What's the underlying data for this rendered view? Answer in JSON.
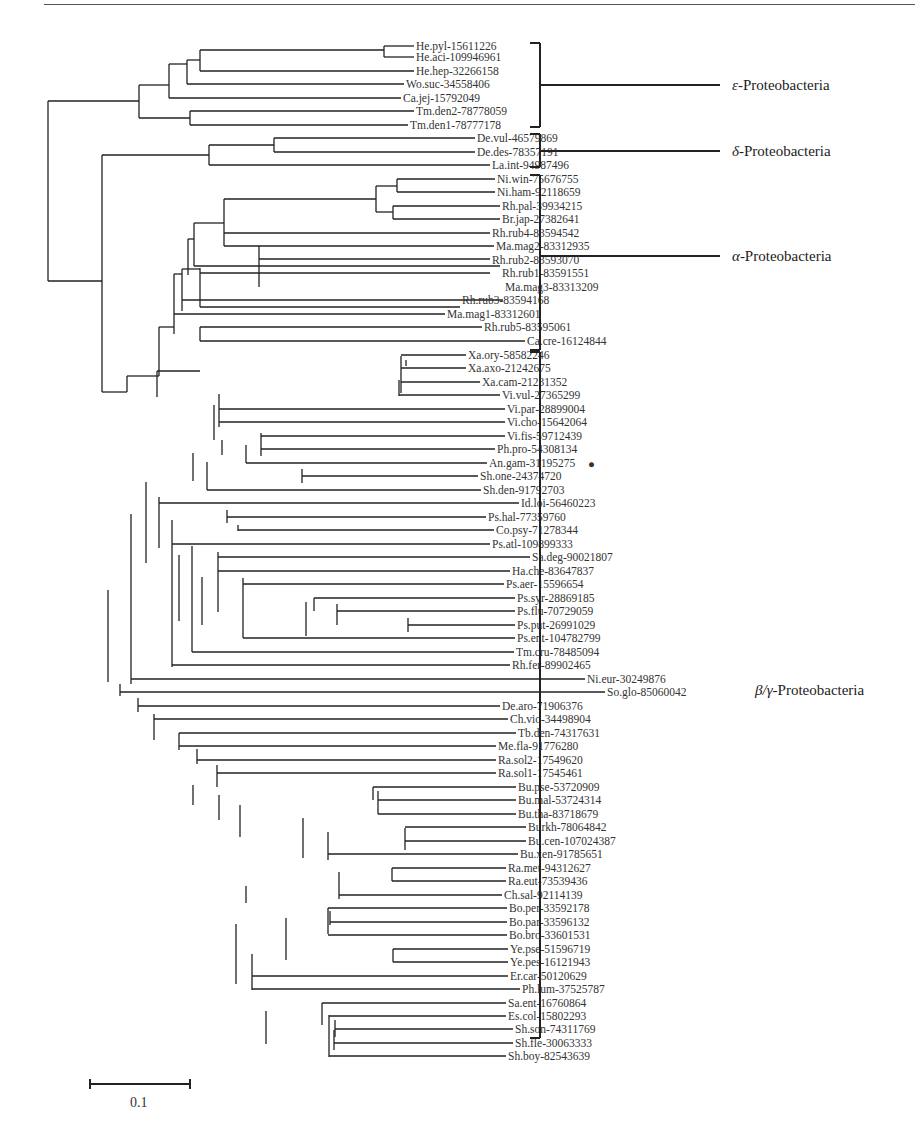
{
  "figure": {
    "type": "phylogenetic-tree",
    "scale_bar": {
      "label": "0.1",
      "x1": 90,
      "x2": 190,
      "y": 1084
    },
    "marker": {
      "leaf": "An.gam-31195275",
      "symbol": "●"
    },
    "clades": [
      {
        "greek": "ε",
        "name": "-Proteobacteria",
        "bracket": {
          "x": 540,
          "y1": 43,
          "y2": 127
        },
        "label_y": 85
      },
      {
        "greek": "δ",
        "name": "-Proteobacteria",
        "bracket": {
          "x": 540,
          "y1": 134,
          "y2": 167
        },
        "label_y": 151
      },
      {
        "greek": "α",
        "name": "-Proteobacteria",
        "bracket": {
          "x": 540,
          "y1": 175,
          "y2": 350
        },
        "label_y": 256
      },
      {
        "greek": "β/γ",
        "name": "-Proteobacteria",
        "bracket": {
          "x": 540,
          "y1": 352,
          "y2": 1038
        },
        "label_y": 690
      }
    ]
  },
  "leaves": [
    {
      "label": "He.pyl-15611226",
      "x": 414,
      "y": 46
    },
    {
      "label": "He.aci-109946961",
      "x": 414,
      "y": 57
    },
    {
      "label": "He.hep-32266158",
      "x": 414,
      "y": 71
    },
    {
      "label": "Wo.suc-34558406",
      "x": 404,
      "y": 84
    },
    {
      "label": "Ca.jej-15792049",
      "x": 401,
      "y": 98
    },
    {
      "label": "Tm.den2-78778059",
      "x": 414,
      "y": 111
    },
    {
      "label": "Tm.den1-78777178",
      "x": 408,
      "y": 125
    },
    {
      "label": "De.vul-46579869",
      "x": 475,
      "y": 138
    },
    {
      "label": "De.des-78357191",
      "x": 475,
      "y": 152
    },
    {
      "label": "La.int-94987496",
      "x": 490,
      "y": 165
    },
    {
      "label": "Ni.win-75676755",
      "x": 495,
      "y": 179
    },
    {
      "label": "Ni.ham-92118659",
      "x": 495,
      "y": 192
    },
    {
      "label": "Rh.pal-39934215",
      "x": 500,
      "y": 206
    },
    {
      "label": "Br.jap-27382641",
      "x": 500,
      "y": 219
    },
    {
      "label": "Rh.rub4-83594542",
      "x": 490,
      "y": 233
    },
    {
      "label": "Ma.mag2-83312935",
      "x": 494,
      "y": 246
    },
    {
      "label": "Rh.rub2-83593070",
      "x": 490,
      "y": 260
    },
    {
      "label": "Rh.rub1-83591551",
      "x": 500,
      "y": 273
    },
    {
      "label": "Ma.mag3-83313209",
      "x": 503,
      "y": 287
    },
    {
      "label": "Rh.rub3-83594168",
      "x": 460,
      "y": 300
    },
    {
      "label": "Ma.mag1-83312601",
      "x": 445,
      "y": 314
    },
    {
      "label": "Rh.rub5-83595061",
      "x": 482,
      "y": 327
    },
    {
      "label": "Ca.cre-16124844",
      "x": 525,
      "y": 341
    },
    {
      "label": "Xa.ory-58582246",
      "x": 466,
      "y": 355
    },
    {
      "label": "Xa.axo-21242675",
      "x": 466,
      "y": 368
    },
    {
      "label": "Xa.cam-21231352",
      "x": 480,
      "y": 382
    },
    {
      "label": "Vi.vul-27365299",
      "x": 500,
      "y": 395
    },
    {
      "label": "Vi.par-28899004",
      "x": 505,
      "y": 409
    },
    {
      "label": "Vi.cho-15642064",
      "x": 505,
      "y": 422
    },
    {
      "label": "Vi.fis-59712439",
      "x": 505,
      "y": 436
    },
    {
      "label": "Ph.pro-54308134",
      "x": 495,
      "y": 449
    },
    {
      "label": "An.gam-31195275",
      "x": 487,
      "y": 463
    },
    {
      "label": "Sh.one-24374720",
      "x": 478,
      "y": 476
    },
    {
      "label": "Sh.den-91792703",
      "x": 481,
      "y": 490
    },
    {
      "label": "Id.loi-56460223",
      "x": 519,
      "y": 503
    },
    {
      "label": "Ps.hal-77359760",
      "x": 486,
      "y": 517
    },
    {
      "label": "Co.psy-71278344",
      "x": 494,
      "y": 530
    },
    {
      "label": "Ps.atl-109899333",
      "x": 490,
      "y": 544
    },
    {
      "label": "Sa.deg-90021807",
      "x": 530,
      "y": 557
    },
    {
      "label": "Ha.che-83647837",
      "x": 510,
      "y": 571
    },
    {
      "label": "Ps.aer-15596654",
      "x": 504,
      "y": 584
    },
    {
      "label": "Ps.syr-28869185",
      "x": 515,
      "y": 598
    },
    {
      "label": "Ps.flu-70729059",
      "x": 515,
      "y": 611
    },
    {
      "label": "Ps.put-26991029",
      "x": 515,
      "y": 625
    },
    {
      "label": "Ps.ent-104782799",
      "x": 515,
      "y": 638
    },
    {
      "label": "Tm.cru-78485094",
      "x": 514,
      "y": 652
    },
    {
      "label": "Rh.fer-89902465",
      "x": 510,
      "y": 665
    },
    {
      "label": "Ni.eur-30249876",
      "x": 585,
      "y": 679
    },
    {
      "label": "So.glo-85060042",
      "x": 605,
      "y": 692
    },
    {
      "label": "De.aro-71906376",
      "x": 500,
      "y": 706
    },
    {
      "label": "Ch.vio-34498904",
      "x": 508,
      "y": 719
    },
    {
      "label": "Tb.den-74317631",
      "x": 516,
      "y": 733
    },
    {
      "label": "Me.fla-91776280",
      "x": 496,
      "y": 746
    },
    {
      "label": "Ra.sol2-17549620",
      "x": 496,
      "y": 760
    },
    {
      "label": "Ra.sol1-17545461",
      "x": 496,
      "y": 773
    },
    {
      "label": "Bu.pse-53720909",
      "x": 516,
      "y": 787
    },
    {
      "label": "Bu.mal-53724314",
      "x": 516,
      "y": 800
    },
    {
      "label": "Bu.tha-83718679",
      "x": 516,
      "y": 814
    },
    {
      "label": "Burkh-78064842",
      "x": 526,
      "y": 827
    },
    {
      "label": "Bu.cen-107024387",
      "x": 526,
      "y": 841
    },
    {
      "label": "Bu.xen-91785651",
      "x": 518,
      "y": 854
    },
    {
      "label": "Ra.met-94312627",
      "x": 506,
      "y": 868
    },
    {
      "label": "Ra.eut-73539436",
      "x": 506,
      "y": 881
    },
    {
      "label": "Ch.sal-92114139",
      "x": 502,
      "y": 895
    },
    {
      "label": "Bo.per-33592178",
      "x": 507,
      "y": 908
    },
    {
      "label": "Bo.par-33596132",
      "x": 507,
      "y": 922
    },
    {
      "label": "Bo.bro-33601531",
      "x": 507,
      "y": 935
    },
    {
      "label": "Ye.pse-51596719",
      "x": 508,
      "y": 949
    },
    {
      "label": "Ye.pes-16121943",
      "x": 508,
      "y": 962
    },
    {
      "label": "Er.car-50120629",
      "x": 508,
      "y": 976
    },
    {
      "label": "Ph.lum-37525787",
      "x": 520,
      "y": 989
    },
    {
      "label": "Sa.ent-16760864",
      "x": 506,
      "y": 1003
    },
    {
      "label": "Es.col-15802293",
      "x": 506,
      "y": 1016
    },
    {
      "label": "Sh.son-74311769",
      "x": 513,
      "y": 1029
    },
    {
      "label": "Sh.fle-30063333",
      "x": 513,
      "y": 1043
    },
    {
      "label": "Sh.boy-82543639",
      "x": 506,
      "y": 1056
    }
  ],
  "edges_v": [
    [
      384,
      46,
      57
    ],
    [
      200,
      50,
      71
    ],
    [
      187,
      60,
      84
    ],
    [
      169,
      64,
      98
    ],
    [
      139,
      85,
      118
    ],
    [
      190,
      111,
      125
    ],
    [
      48,
      101,
      281
    ],
    [
      274,
      138,
      152
    ],
    [
      209,
      145,
      165
    ],
    [
      102,
      155,
      392
    ],
    [
      376,
      186,
      212
    ],
    [
      397,
      179,
      192
    ],
    [
      393,
      206,
      219
    ],
    [
      224,
      199,
      246
    ],
    [
      259,
      246,
      287
    ],
    [
      194,
      223,
      266
    ],
    [
      188,
      239,
      275
    ],
    [
      200,
      268,
      307
    ],
    [
      182,
      269,
      311
    ],
    [
      174,
      274,
      334
    ],
    [
      200,
      327,
      341
    ],
    [
      159,
      327,
      376
    ],
    [
      127,
      376,
      392
    ],
    [
      157,
      371,
      397
    ],
    [
      406,
      360,
      366
    ],
    [
      401,
      356,
      393
    ],
    [
      399,
      380,
      396
    ],
    [
      219,
      394,
      427
    ],
    [
      261,
      433,
      456
    ],
    [
      214,
      405,
      440
    ],
    [
      222,
      440,
      455
    ],
    [
      246,
      445,
      463
    ],
    [
      302,
      469,
      483
    ],
    [
      193,
      453,
      481
    ],
    [
      207,
      462,
      490
    ],
    [
      227,
      510,
      523
    ],
    [
      159,
      497,
      548
    ],
    [
      238,
      525,
      531
    ],
    [
      146,
      482,
      563
    ],
    [
      314,
      598,
      611
    ],
    [
      408,
      618,
      632
    ],
    [
      337,
      604,
      625
    ],
    [
      306,
      602,
      636
    ],
    [
      243,
      578,
      638
    ],
    [
      202,
      577,
      625
    ],
    [
      179,
      555,
      621
    ],
    [
      218,
      552,
      612
    ],
    [
      192,
      546,
      652
    ],
    [
      172,
      520,
      667
    ],
    [
      131,
      514,
      684
    ],
    [
      108,
      590,
      682
    ],
    [
      120,
      684,
      696
    ],
    [
      138,
      698,
      712
    ],
    [
      154,
      714,
      740
    ],
    [
      179,
      733,
      750
    ],
    [
      197,
      749,
      764
    ],
    [
      217,
      765,
      787
    ],
    [
      193,
      785,
      805
    ],
    [
      219,
      795,
      820
    ],
    [
      240,
      805,
      837
    ],
    [
      373,
      787,
      800
    ],
    [
      378,
      791,
      814
    ],
    [
      405,
      828,
      850
    ],
    [
      303,
      818,
      858
    ],
    [
      328,
      832,
      860
    ],
    [
      392,
      868,
      881
    ],
    [
      339,
      872,
      899
    ],
    [
      246,
      886,
      903
    ],
    [
      328,
      908,
      934
    ],
    [
      330,
      911,
      925
    ],
    [
      286,
      918,
      960
    ],
    [
      393,
      949,
      962
    ],
    [
      236,
      924,
      984
    ],
    [
      252,
      954,
      990
    ],
    [
      322,
      1003,
      1025
    ],
    [
      266,
      1011,
      1044
    ],
    [
      329,
      1015,
      1057
    ],
    [
      335,
      1020,
      1037
    ],
    [
      334,
      1030,
      1050
    ]
  ],
  "edges_h": [
    [
      200,
      384,
      50
    ],
    [
      384,
      414,
      46
    ],
    [
      384,
      414,
      57
    ],
    [
      187,
      200,
      60
    ],
    [
      200,
      414,
      71
    ],
    [
      169,
      187,
      64
    ],
    [
      187,
      404,
      84
    ],
    [
      139,
      169,
      85
    ],
    [
      169,
      401,
      98
    ],
    [
      139,
      190,
      118
    ],
    [
      190,
      414,
      111
    ],
    [
      190,
      408,
      125
    ],
    [
      48,
      139,
      101
    ],
    [
      209,
      274,
      145
    ],
    [
      274,
      475,
      138
    ],
    [
      274,
      475,
      152
    ],
    [
      209,
      490,
      165
    ],
    [
      102,
      209,
      155
    ],
    [
      48,
      102,
      281
    ],
    [
      397,
      495,
      179
    ],
    [
      397,
      495,
      192
    ],
    [
      376,
      397,
      186
    ],
    [
      393,
      500,
      206
    ],
    [
      393,
      500,
      219
    ],
    [
      376,
      393,
      212
    ],
    [
      224,
      376,
      199
    ],
    [
      194,
      224,
      223
    ],
    [
      224,
      490,
      233
    ],
    [
      259,
      494,
      246
    ],
    [
      259,
      490,
      259
    ],
    [
      224,
      259,
      246
    ],
    [
      200,
      490,
      273
    ],
    [
      188,
      194,
      239
    ],
    [
      194,
      500,
      266
    ],
    [
      174,
      182,
      274
    ],
    [
      182,
      200,
      269
    ],
    [
      182,
      503,
      300
    ],
    [
      200,
      460,
      307
    ],
    [
      159,
      174,
      327
    ],
    [
      174,
      445,
      314
    ],
    [
      200,
      482,
      327
    ],
    [
      200,
      525,
      341
    ],
    [
      127,
      159,
      376
    ],
    [
      157,
      200,
      371
    ],
    [
      102,
      127,
      392
    ]
  ],
  "note": "Tree geometry is approximated; leaf labels are exact."
}
